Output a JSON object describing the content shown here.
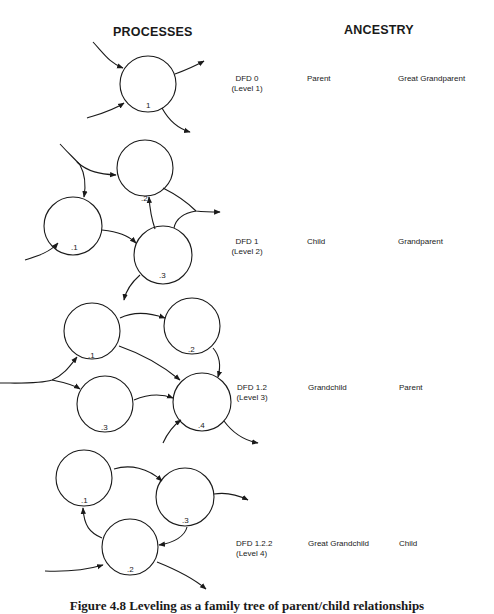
{
  "headers": {
    "processes": "PROCESSES",
    "ancestry": "ANCESTRY"
  },
  "levels": [
    {
      "dfd": "DFD 0",
      "level": "(Level  1)",
      "relation_a": "Parent",
      "relation_b": "Great  Grandparent",
      "processes": [
        "1"
      ]
    },
    {
      "dfd": "DFD 1",
      "level": "(Level  2)",
      "relation_a": "Child",
      "relation_b": "Grandparent",
      "processes": [
        ".1",
        ".2",
        ".3"
      ]
    },
    {
      "dfd": "DFD 1.2",
      "level": "(Level  3)",
      "relation_a": "Grandchild",
      "relation_b": "Parent",
      "processes": [
        ".1",
        ".2",
        ".3",
        ".4"
      ]
    },
    {
      "dfd": "DFD 1.2.2",
      "level": "(Level  4)",
      "relation_a": "Great  Grandchild",
      "relation_b": "Child",
      "processes": [
        ".1",
        ".2",
        ".3"
      ]
    }
  ],
  "caption": "Figure 4.8 Leveling as a family tree of parent/child relationships"
}
